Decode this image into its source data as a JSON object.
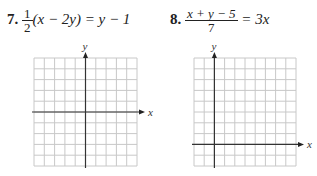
{
  "problems": [
    {
      "number": "7.",
      "equation": {
        "frac_num": "1",
        "frac_den": "2",
        "rest": "(x − 2y) = y − 1"
      },
      "graph": {
        "x_label": "x",
        "y_label": "y",
        "grid_cells": [
          10,
          10
        ],
        "origin_cell": [
          5,
          5
        ]
      }
    },
    {
      "number": "8.",
      "equation": {
        "frac_num": "x + y − 5",
        "frac_den": "7",
        "rest": "= 3x"
      },
      "graph": {
        "x_label": "x",
        "y_label": "y",
        "grid_cells": [
          10,
          10
        ],
        "origin_cell": [
          2,
          8
        ]
      }
    }
  ]
}
